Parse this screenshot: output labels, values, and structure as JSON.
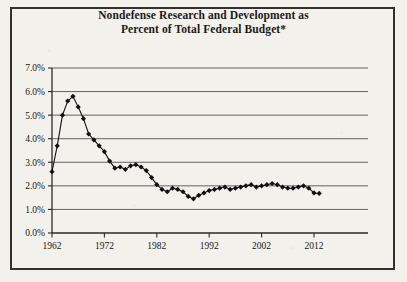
{
  "document": {
    "title_line_1": "Nondefense Research and Development as",
    "title_line_2": "Percent of Total Federal Budget*"
  },
  "colors": {
    "paper": "#f3f1ec",
    "border": "#333031",
    "gridline": "#555253",
    "axis": "#2a2829",
    "series": "#111111",
    "text": "#161616"
  },
  "chart_data": {
    "type": "line",
    "title": "Nondefense Research and Development as Percent of Total Federal Budget*",
    "xlabel": "",
    "ylabel": "",
    "xlim": [
      1961,
      2014
    ],
    "ylim": [
      0,
      7
    ],
    "grid": true,
    "legend": "none",
    "marker": "diamond",
    "y_tick_labels": [
      "0.0%",
      "1.0%",
      "2.0%",
      "3.0%",
      "4.0%",
      "5.0%",
      "6.0%",
      "7.0%"
    ],
    "y_tick_values": [
      0,
      1,
      2,
      3,
      4,
      5,
      6,
      7
    ],
    "x_tick_labels": [
      "1962",
      "1972",
      "1982",
      "1992",
      "2002",
      "2012"
    ],
    "x_tick_values": [
      1962,
      1972,
      1982,
      1992,
      2002,
      2012
    ],
    "x": [
      1962,
      1963,
      1964,
      1965,
      1966,
      1967,
      1968,
      1969,
      1970,
      1971,
      1972,
      1973,
      1974,
      1975,
      1976,
      1977,
      1978,
      1979,
      1980,
      1981,
      1982,
      1983,
      1984,
      1985,
      1986,
      1987,
      1988,
      1989,
      1990,
      1991,
      1992,
      1993,
      1994,
      1995,
      1996,
      1997,
      1998,
      1999,
      2000,
      2001,
      2002,
      2003,
      2004,
      2005,
      2006,
      2007,
      2008,
      2009,
      2010,
      2011,
      2012,
      2013
    ],
    "values": [
      2.6,
      3.7,
      5.0,
      5.6,
      5.8,
      5.35,
      4.85,
      4.2,
      3.95,
      3.7,
      3.45,
      3.05,
      2.75,
      2.8,
      2.7,
      2.85,
      2.9,
      2.8,
      2.65,
      2.35,
      2.05,
      1.85,
      1.75,
      1.9,
      1.85,
      1.75,
      1.55,
      1.45,
      1.6,
      1.7,
      1.8,
      1.85,
      1.9,
      1.95,
      1.85,
      1.9,
      1.95,
      2.0,
      2.05,
      1.95,
      2.0,
      2.05,
      2.1,
      2.05,
      1.95,
      1.9,
      1.9,
      1.95,
      2.0,
      1.9,
      1.7,
      1.68
    ],
    "series": [
      {
        "name": "Nondefense R&D as percent of total federal budget",
        "values": [
          2.6,
          3.7,
          5.0,
          5.6,
          5.8,
          5.35,
          4.85,
          4.2,
          3.95,
          3.7,
          3.45,
          3.05,
          2.75,
          2.8,
          2.7,
          2.85,
          2.9,
          2.8,
          2.65,
          2.35,
          2.05,
          1.85,
          1.75,
          1.9,
          1.85,
          1.75,
          1.55,
          1.45,
          1.6,
          1.7,
          1.8,
          1.85,
          1.9,
          1.95,
          1.85,
          1.9,
          1.95,
          2.0,
          2.05,
          1.95,
          2.0,
          2.05,
          2.1,
          2.05,
          1.95,
          1.9,
          1.9,
          1.95,
          2.0,
          1.9,
          1.7,
          1.68
        ]
      }
    ],
    "annotations": {
      "peak_year": 1965,
      "peak_value": 5.8,
      "trough_year": 1989,
      "trough_value": 1.45,
      "footnote_marker": "*"
    }
  }
}
